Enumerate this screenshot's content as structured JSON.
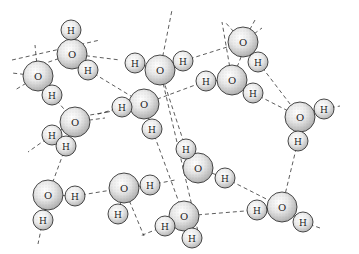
{
  "figure": {
    "title": "",
    "colors": {
      "background": "#ffffff",
      "outline": "#333333",
      "shading": "#9a9a9a",
      "hbond": "#333333"
    },
    "legend": []
  },
  "molecules": [
    {
      "O": {
        "x": 72,
        "y": 54,
        "label": "O"
      },
      "H": [
        {
          "x": 71,
          "y": 30,
          "label": "H"
        },
        {
          "x": 88,
          "y": 70,
          "label": "H"
        }
      ]
    },
    {
      "O": {
        "x": 38,
        "y": 76,
        "label": "O"
      },
      "H": [
        {
          "x": 52,
          "y": 95,
          "label": "H"
        }
      ]
    },
    {
      "O": {
        "x": 160,
        "y": 70,
        "label": "O"
      },
      "H": [
        {
          "x": 135,
          "y": 63,
          "label": "H"
        },
        {
          "x": 183,
          "y": 61,
          "label": "H"
        }
      ]
    },
    {
      "O": {
        "x": 243,
        "y": 42,
        "label": "O"
      },
      "H": [
        {
          "x": 258,
          "y": 62,
          "label": "H"
        }
      ]
    },
    {
      "O": {
        "x": 232,
        "y": 80,
        "label": "O"
      },
      "H": [
        {
          "x": 206,
          "y": 81,
          "label": "H"
        },
        {
          "x": 253,
          "y": 93,
          "label": "H"
        }
      ]
    },
    {
      "O": {
        "x": 300,
        "y": 117,
        "label": "O"
      },
      "H": [
        {
          "x": 324,
          "y": 109,
          "label": "H"
        },
        {
          "x": 298,
          "y": 141,
          "label": "H"
        }
      ]
    },
    {
      "O": {
        "x": 144,
        "y": 104,
        "label": "O"
      },
      "H": [
        {
          "x": 122,
          "y": 107,
          "label": "H"
        },
        {
          "x": 152,
          "y": 129,
          "label": "H"
        }
      ]
    },
    {
      "O": {
        "x": 75,
        "y": 122,
        "label": "O"
      },
      "H": [
        {
          "x": 52,
          "y": 135,
          "label": "H"
        },
        {
          "x": 66,
          "y": 146,
          "label": "H"
        }
      ]
    },
    {
      "O": {
        "x": 198,
        "y": 168,
        "label": "O"
      },
      "H": [
        {
          "x": 186,
          "y": 149,
          "label": "H"
        },
        {
          "x": 225,
          "y": 178,
          "label": "H"
        }
      ]
    },
    {
      "O": {
        "x": 48,
        "y": 195,
        "label": "O"
      },
      "H": [
        {
          "x": 75,
          "y": 196,
          "label": "H"
        },
        {
          "x": 43,
          "y": 220,
          "label": "H"
        }
      ]
    },
    {
      "O": {
        "x": 124,
        "y": 188,
        "label": "O"
      },
      "H": [
        {
          "x": 150,
          "y": 185,
          "label": "H"
        },
        {
          "x": 118,
          "y": 214,
          "label": "H"
        }
      ]
    },
    {
      "O": {
        "x": 282,
        "y": 207,
        "label": "O"
      },
      "H": [
        {
          "x": 257,
          "y": 210,
          "label": "H"
        },
        {
          "x": 303,
          "y": 222,
          "label": "H"
        }
      ]
    },
    {
      "O": {
        "x": 184,
        "y": 216,
        "label": "O"
      },
      "H": [
        {
          "x": 165,
          "y": 226,
          "label": "H"
        },
        {
          "x": 192,
          "y": 238,
          "label": "H"
        }
      ]
    }
  ],
  "hbonds": [
    [
      12,
      60,
      100,
      40
    ],
    [
      88,
      70,
      144,
      104
    ],
    [
      38,
      76,
      15,
      90
    ],
    [
      38,
      76,
      35,
      45
    ],
    [
      38,
      76,
      12,
      73
    ],
    [
      52,
      95,
      75,
      122
    ],
    [
      72,
      54,
      120,
      60
    ],
    [
      72,
      54,
      40,
      65
    ],
    [
      160,
      70,
      172,
      10
    ],
    [
      160,
      70,
      200,
      240
    ],
    [
      183,
      61,
      243,
      42
    ],
    [
      243,
      42,
      255,
      20
    ],
    [
      243,
      42,
      225,
      22
    ],
    [
      243,
      42,
      262,
      28
    ],
    [
      232,
      80,
      222,
      22
    ],
    [
      232,
      80,
      243,
      52
    ],
    [
      258,
      62,
      300,
      117
    ],
    [
      253,
      93,
      300,
      117
    ],
    [
      324,
      109,
      340,
      106
    ],
    [
      298,
      141,
      282,
      207
    ],
    [
      144,
      104,
      108,
      112
    ],
    [
      108,
      112,
      90,
      115
    ],
    [
      144,
      104,
      206,
      81
    ],
    [
      152,
      129,
      184,
      216
    ],
    [
      75,
      122,
      105,
      118
    ],
    [
      52,
      135,
      28,
      152
    ],
    [
      66,
      146,
      48,
      195
    ],
    [
      122,
      107,
      95,
      115
    ],
    [
      186,
      149,
      160,
      70
    ],
    [
      225,
      178,
      282,
      207
    ],
    [
      75,
      196,
      124,
      188
    ],
    [
      150,
      185,
      175,
      180
    ],
    [
      124,
      188,
      144,
      236
    ],
    [
      43,
      220,
      38,
      244
    ],
    [
      165,
      226,
      140,
      236
    ],
    [
      184,
      216,
      257,
      210
    ],
    [
      303,
      222,
      320,
      228
    ]
  ]
}
